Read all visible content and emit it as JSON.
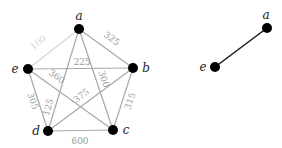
{
  "left_graph": {
    "nodes": [
      {
        "id": "a",
        "label": "a",
        "x": 79,
        "y": 29
      },
      {
        "id": "b",
        "label": "b",
        "x": 133,
        "y": 68
      },
      {
        "id": "c",
        "label": "c",
        "x": 113,
        "y": 130
      },
      {
        "id": "d",
        "label": "d",
        "x": 48,
        "y": 131
      },
      {
        "id": "e",
        "label": "e",
        "x": 28,
        "y": 69
      }
    ],
    "edges": [
      {
        "from": "a",
        "to": "e",
        "weight": "100"
      },
      {
        "from": "a",
        "to": "b",
        "weight": "325"
      },
      {
        "from": "e",
        "to": "b",
        "weight": "225"
      },
      {
        "from": "a",
        "to": "c",
        "weight": "300"
      },
      {
        "from": "e",
        "to": "c",
        "weight": "360"
      },
      {
        "from": "a",
        "to": "d",
        "weight": "125"
      },
      {
        "from": "d",
        "to": "b",
        "weight": "375"
      },
      {
        "from": "e",
        "to": "d",
        "weight": "305"
      },
      {
        "from": "b",
        "to": "c",
        "weight": "315"
      },
      {
        "from": "d",
        "to": "c",
        "weight": "600"
      }
    ]
  },
  "right_graph": {
    "nodes": [
      {
        "id": "a",
        "label": "a",
        "x": 267,
        "y": 28
      },
      {
        "id": "e",
        "label": "e",
        "x": 215,
        "y": 67
      }
    ],
    "edges": [
      {
        "from": "e",
        "to": "a"
      }
    ]
  },
  "colors": {
    "edge": "#a8a8a8",
    "edge_light": "#d4d4d4",
    "selected_edge": "#1a1a1a",
    "node": "#000000",
    "weight_text": "#9a9a9a"
  }
}
